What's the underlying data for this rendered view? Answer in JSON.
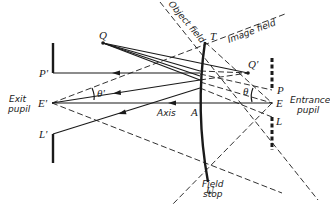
{
  "diagram": {
    "type": "optics-ray-diagram",
    "labels": {
      "Q": "Q",
      "Q_prime": "Q'",
      "T": "T",
      "U": "U",
      "A": "A",
      "P": "P",
      "P_prime": "P'",
      "L": "L",
      "L_prime": "L'",
      "E": "E",
      "E_prime": "E'",
      "theta": "θ",
      "theta_prime": "θ'",
      "axis": "Axis",
      "object_field": "Object field",
      "image_field": "Image field",
      "exit_pupil_line1": "Exit",
      "exit_pupil_line2": "pupil",
      "entrance_pupil_line1": "Entrance",
      "entrance_pupil_line2": "pupil",
      "field_stop_line1": "Field",
      "field_stop_line2": "stop"
    }
  }
}
